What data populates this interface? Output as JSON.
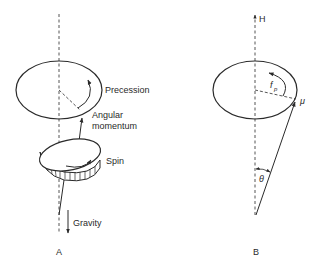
{
  "panel_a": {
    "label": "A",
    "precession_label": "Precession",
    "angular_momentum_label_1": "Angular",
    "angular_momentum_label_2": "momentum",
    "spin_label": "Spin",
    "gravity_label": "Gravity"
  },
  "panel_b": {
    "label": "B",
    "field_label": "H",
    "moment_label": "μ",
    "precession_freq_label": "f",
    "precession_freq_subscript": "p",
    "angle_label": "θ"
  },
  "colors": {
    "line": "#2a2a2a",
    "background": "#ffffff"
  }
}
